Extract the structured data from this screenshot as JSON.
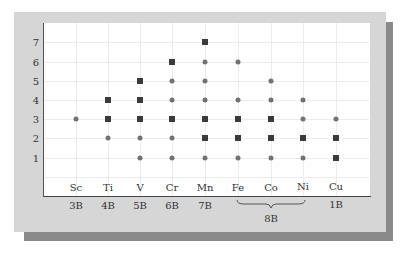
{
  "chart_data": {
    "type": "scatter",
    "title": "",
    "xlabel": "",
    "ylabel": "",
    "ylim": [
      0,
      7
    ],
    "grid": true,
    "categories": [
      "Sc",
      "Ti",
      "V",
      "Cr",
      "Mn",
      "Fe",
      "Co",
      "Ni",
      "Cu"
    ],
    "groups": [
      "3B",
      "4B",
      "5B",
      "6B",
      "7B",
      "8B",
      "8B",
      "8B",
      "1B"
    ],
    "group_labels": [
      {
        "label": "3B",
        "span": [
          "Sc"
        ]
      },
      {
        "label": "4B",
        "span": [
          "Ti"
        ]
      },
      {
        "label": "5B",
        "span": [
          "V"
        ]
      },
      {
        "label": "6B",
        "span": [
          "Cr"
        ]
      },
      {
        "label": "7B",
        "span": [
          "Mn"
        ]
      },
      {
        "label": "8B",
        "span": [
          "Fe",
          "Co",
          "Ni"
        ]
      },
      {
        "label": "1B",
        "span": [
          "Cu"
        ]
      }
    ],
    "y_ticks": [
      1,
      2,
      3,
      4,
      5,
      6,
      7
    ],
    "marker_legend": {
      "square": "common oxidation state (dark square)",
      "circle": "other oxidation state (gray circle)"
    },
    "series": [
      {
        "name": "Sc",
        "states": [
          {
            "y": 3,
            "marker": "circle"
          }
        ]
      },
      {
        "name": "Ti",
        "states": [
          {
            "y": 2,
            "marker": "circle"
          },
          {
            "y": 3,
            "marker": "square"
          },
          {
            "y": 4,
            "marker": "square"
          }
        ]
      },
      {
        "name": "V",
        "states": [
          {
            "y": 1,
            "marker": "circle"
          },
          {
            "y": 2,
            "marker": "circle"
          },
          {
            "y": 3,
            "marker": "square"
          },
          {
            "y": 4,
            "marker": "square"
          },
          {
            "y": 5,
            "marker": "square"
          }
        ]
      },
      {
        "name": "Cr",
        "states": [
          {
            "y": 1,
            "marker": "circle"
          },
          {
            "y": 2,
            "marker": "circle"
          },
          {
            "y": 3,
            "marker": "square"
          },
          {
            "y": 4,
            "marker": "circle"
          },
          {
            "y": 5,
            "marker": "circle"
          },
          {
            "y": 6,
            "marker": "square"
          }
        ]
      },
      {
        "name": "Mn",
        "states": [
          {
            "y": 1,
            "marker": "circle"
          },
          {
            "y": 2,
            "marker": "square"
          },
          {
            "y": 3,
            "marker": "square"
          },
          {
            "y": 4,
            "marker": "circle"
          },
          {
            "y": 5,
            "marker": "circle"
          },
          {
            "y": 6,
            "marker": "circle"
          },
          {
            "y": 7,
            "marker": "square"
          }
        ]
      },
      {
        "name": "Fe",
        "states": [
          {
            "y": 1,
            "marker": "circle"
          },
          {
            "y": 2,
            "marker": "square"
          },
          {
            "y": 3,
            "marker": "square"
          },
          {
            "y": 4,
            "marker": "circle"
          },
          {
            "y": 6,
            "marker": "circle"
          }
        ]
      },
      {
        "name": "Co",
        "states": [
          {
            "y": 1,
            "marker": "circle"
          },
          {
            "y": 2,
            "marker": "square"
          },
          {
            "y": 3,
            "marker": "square"
          },
          {
            "y": 4,
            "marker": "circle"
          },
          {
            "y": 5,
            "marker": "circle"
          }
        ]
      },
      {
        "name": "Ni",
        "states": [
          {
            "y": 1,
            "marker": "circle"
          },
          {
            "y": 2,
            "marker": "square"
          },
          {
            "y": 3,
            "marker": "circle"
          },
          {
            "y": 4,
            "marker": "circle"
          }
        ]
      },
      {
        "name": "Cu",
        "states": [
          {
            "y": 1,
            "marker": "square"
          },
          {
            "y": 2,
            "marker": "square"
          },
          {
            "y": 3,
            "marker": "circle"
          }
        ]
      }
    ],
    "colors": {
      "square": "#3a3a3a",
      "circle": "#727272",
      "frame": "#d6d6d6",
      "shadow": "#8a8a8a",
      "grid": "#ececec"
    }
  },
  "labels": {
    "y": [
      "1",
      "2",
      "3",
      "4",
      "5",
      "6",
      "7"
    ],
    "x": [
      "Sc",
      "Ti",
      "V",
      "Cr",
      "Mn",
      "Fe",
      "Co",
      "Ni",
      "Cu"
    ],
    "groups": {
      "g3B": "3B",
      "g4B": "4B",
      "g5B": "5B",
      "g6B": "6B",
      "g7B": "7B",
      "g8B": "8B",
      "g1B": "1B"
    }
  }
}
